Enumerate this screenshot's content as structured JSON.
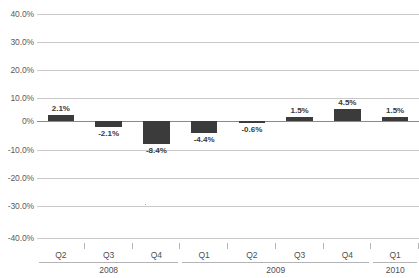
{
  "chart_data": {
    "type": "bar",
    "title": "",
    "subtitle": "",
    "xlabel": "",
    "ylabel": "",
    "categories": [
      "Q2",
      "Q3",
      "Q4",
      "Q1",
      "Q2",
      "Q3",
      "Q4",
      "Q1"
    ],
    "values": [
      2.1,
      -2.1,
      -8.4,
      -4.4,
      -0.6,
      1.5,
      4.5,
      1.5
    ],
    "data_labels": [
      "2.1%",
      "-2.1%",
      "-8.4%",
      "-4.4%",
      "-0.6%",
      "1.5%",
      "4.5%",
      "1.5%"
    ],
    "groups": [
      {
        "label": "2008",
        "categories": [
          "Q2",
          "Q3",
          "Q4"
        ],
        "count": 3
      },
      {
        "label": "2009",
        "categories": [
          "Q1",
          "Q2",
          "Q3",
          "Q4"
        ],
        "count": 4
      },
      {
        "label": "2010",
        "categories": [
          "Q1"
        ],
        "count": 1
      }
    ],
    "ylim": [
      -40,
      40
    ],
    "ytick_values": [
      40,
      30,
      20,
      10,
      0,
      -10,
      -20,
      -30,
      -40
    ],
    "ytick_labels": [
      "40.0%",
      "30.0%",
      "20.0%",
      "10.0%",
      "0%",
      "-10.0%",
      "-20.0%",
      "-30.0%",
      "-40.0%"
    ],
    "grid": true,
    "legend": false,
    "legend_position": "none",
    "series": [
      {
        "name": "",
        "values": [
          2.1,
          -2.1,
          -8.4,
          -4.4,
          -0.6,
          1.5,
          4.5,
          1.5
        ],
        "color": "#3b3b3b"
      }
    ]
  },
  "colors": {
    "bar": "#3b3b3b",
    "gridline": "#c9c9c9",
    "zero_line": "#8a8a8a",
    "axis_text": "#4f4f4f",
    "label_text": "#3a3a3a",
    "background": "#ffffff"
  }
}
